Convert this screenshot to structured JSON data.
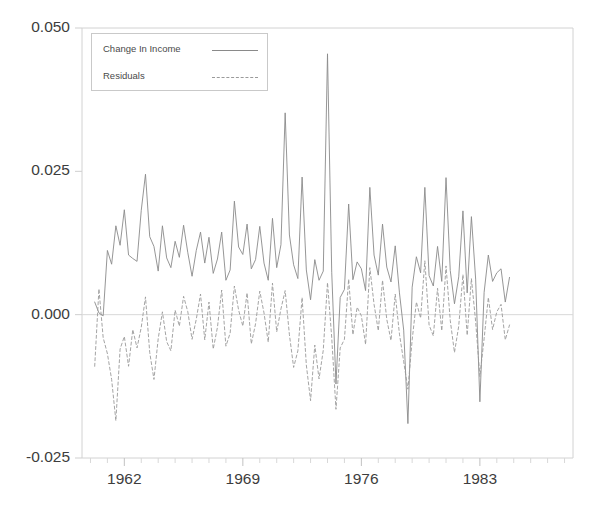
{
  "chart_data": {
    "type": "line",
    "title": "",
    "xlabel": "",
    "ylabel": "",
    "ylim": [
      -0.025,
      0.05
    ],
    "yticks": [
      0.05,
      0.025,
      0.0,
      -0.025
    ],
    "ytick_labels": [
      "0.050",
      "0.025",
      "0.000",
      "-0.025"
    ],
    "xlim": [
      1959.5,
      1988.5
    ],
    "xticks": [
      1962,
      1969,
      1976,
      1983
    ],
    "xtick_labels": [
      "1962",
      "1969",
      "1976",
      "1983"
    ],
    "minor_xticks": true,
    "grid": false,
    "legend_position": "upper left",
    "zero_line": 0.0,
    "x_start": 1960.25,
    "x_step": 0.25,
    "series": [
      {
        "name": "Change In Income",
        "style": "solid",
        "color": "#8a8a8a",
        "values": [
          0.0022,
          0.0003,
          -0.0002,
          0.0112,
          0.0088,
          0.0155,
          0.0121,
          0.0183,
          0.0104,
          0.0098,
          0.0093,
          0.0182,
          0.0245,
          0.0136,
          0.0119,
          0.0076,
          0.0155,
          0.0099,
          0.0082,
          0.0128,
          0.01,
          0.0156,
          0.0108,
          0.0067,
          0.0112,
          0.0144,
          0.009,
          0.0135,
          0.0072,
          0.0097,
          0.0144,
          0.006,
          0.0078,
          0.0198,
          0.0118,
          0.0105,
          0.0158,
          0.008,
          0.0096,
          0.0154,
          0.009,
          0.006,
          0.0168,
          0.0082,
          0.0122,
          0.0352,
          0.0139,
          0.0087,
          0.0063,
          0.024,
          0.0078,
          0.0026,
          0.0096,
          0.006,
          0.0076,
          0.0455,
          0.0074,
          -0.0121,
          0.003,
          0.0044,
          0.0193,
          0.0061,
          0.0092,
          0.008,
          0.0042,
          0.0222,
          0.0104,
          0.0069,
          0.0158,
          0.0083,
          0.0057,
          0.012,
          0.0038,
          -0.0027,
          -0.019,
          0.0048,
          0.0101,
          0.0073,
          0.0222,
          0.0068,
          0.005,
          0.0119,
          0.0058,
          0.0239,
          0.0077,
          0.0019,
          0.0066,
          0.0181,
          0.0038,
          0.0171,
          0.0062,
          -0.0152,
          0.0039,
          0.0104,
          0.0058,
          0.0073,
          0.008,
          0.0022,
          0.0065
        ]
      },
      {
        "name": "Residuals",
        "style": "dashed",
        "color": "#9a9a9a",
        "values": [
          -0.009,
          0.0045,
          -0.004,
          -0.0068,
          -0.0113,
          -0.0185,
          -0.006,
          -0.0038,
          -0.009,
          -0.0026,
          -0.0058,
          -0.0022,
          0.0031,
          -0.0066,
          -0.0113,
          -0.0042,
          0.0005,
          -0.0047,
          -0.0063,
          0.0008,
          -0.002,
          0.0032,
          0.0005,
          -0.0043,
          -0.0008,
          0.0036,
          -0.0044,
          0.0022,
          -0.006,
          -0.0022,
          0.0043,
          -0.0055,
          -0.0032,
          0.005,
          0.0008,
          -0.002,
          0.0038,
          -0.0051,
          -0.0016,
          0.0041,
          0.0003,
          -0.0048,
          0.0055,
          -0.003,
          0.001,
          0.0042,
          -0.0035,
          -0.0092,
          -0.0063,
          0.003,
          -0.0088,
          -0.015,
          -0.0053,
          -0.0112,
          -0.0062,
          0.0056,
          -0.004,
          -0.0165,
          -0.0058,
          -0.0043,
          0.0062,
          -0.0035,
          0.0013,
          -0.0002,
          -0.0052,
          0.0082,
          0.0018,
          -0.0028,
          0.006,
          -0.0008,
          -0.0045,
          0.0036,
          -0.0034,
          -0.0082,
          -0.013,
          -0.0044,
          0.0022,
          -0.0006,
          0.0094,
          -0.0018,
          -0.0037,
          0.0046,
          -0.0028,
          0.0085,
          -0.001,
          -0.0066,
          -0.002,
          0.007,
          -0.0036,
          0.0063,
          -0.0012,
          -0.0108,
          -0.0042,
          0.003,
          -0.0026,
          0.0005,
          0.0018,
          -0.0044,
          -0.0018
        ]
      }
    ]
  },
  "legend": {
    "items": [
      {
        "label": "Change In Income",
        "style": "solid"
      },
      {
        "label": "Residuals",
        "style": "dashed"
      }
    ]
  }
}
